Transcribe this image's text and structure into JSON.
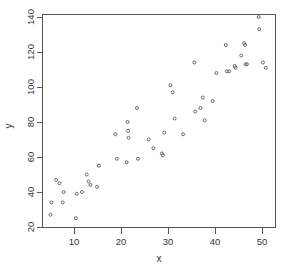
{
  "chart_data": {
    "type": "scatter",
    "title": "",
    "xlabel": "x",
    "ylabel": "y",
    "xlim": [
      3.5,
      52.5
    ],
    "ylim": [
      19,
      142
    ],
    "grid": false,
    "legend": null,
    "x_ticks": [
      10,
      20,
      30,
      40,
      50
    ],
    "y_ticks": [
      20,
      40,
      60,
      80,
      100,
      120,
      140
    ],
    "x_tick_labels": [
      "10",
      "20",
      "30",
      "40",
      "50"
    ],
    "y_tick_labels": [
      "20",
      "40",
      "60",
      "80",
      "100",
      "120",
      "140"
    ],
    "marker": "open-circle",
    "marker_color": "#6b6b6b",
    "n_points": 62,
    "points": [
      {
        "x": 5.0,
        "y": 27
      },
      {
        "x": 5.2,
        "y": 34
      },
      {
        "x": 6.2,
        "y": 47
      },
      {
        "x": 6.9,
        "y": 45
      },
      {
        "x": 7.6,
        "y": 34
      },
      {
        "x": 7.8,
        "y": 40
      },
      {
        "x": 10.4,
        "y": 25
      },
      {
        "x": 10.6,
        "y": 39
      },
      {
        "x": 11.7,
        "y": 40
      },
      {
        "x": 12.7,
        "y": 50
      },
      {
        "x": 13.1,
        "y": 46
      },
      {
        "x": 13.5,
        "y": 44
      },
      {
        "x": 14.9,
        "y": 43
      },
      {
        "x": 15.3,
        "y": 55
      },
      {
        "x": 18.8,
        "y": 73
      },
      {
        "x": 19.1,
        "y": 59
      },
      {
        "x": 21.2,
        "y": 57
      },
      {
        "x": 21.4,
        "y": 80
      },
      {
        "x": 21.5,
        "y": 75
      },
      {
        "x": 21.6,
        "y": 71
      },
      {
        "x": 23.4,
        "y": 88
      },
      {
        "x": 23.6,
        "y": 59
      },
      {
        "x": 25.9,
        "y": 70
      },
      {
        "x": 26.9,
        "y": 65
      },
      {
        "x": 28.7,
        "y": 62
      },
      {
        "x": 28.9,
        "y": 61
      },
      {
        "x": 29.2,
        "y": 74
      },
      {
        "x": 30.5,
        "y": 101
      },
      {
        "x": 31.0,
        "y": 97
      },
      {
        "x": 31.4,
        "y": 82
      },
      {
        "x": 33.2,
        "y": 73
      },
      {
        "x": 35.6,
        "y": 114
      },
      {
        "x": 35.8,
        "y": 86
      },
      {
        "x": 36.9,
        "y": 88
      },
      {
        "x": 37.4,
        "y": 94
      },
      {
        "x": 37.8,
        "y": 81
      },
      {
        "x": 39.5,
        "y": 92
      },
      {
        "x": 40.3,
        "y": 108
      },
      {
        "x": 42.3,
        "y": 124
      },
      {
        "x": 42.5,
        "y": 109
      },
      {
        "x": 43.0,
        "y": 109
      },
      {
        "x": 44.2,
        "y": 112
      },
      {
        "x": 44.4,
        "y": 111
      },
      {
        "x": 45.6,
        "y": 118
      },
      {
        "x": 46.2,
        "y": 125
      },
      {
        "x": 46.4,
        "y": 124
      },
      {
        "x": 46.5,
        "y": 113
      },
      {
        "x": 46.8,
        "y": 113
      },
      {
        "x": 49.3,
        "y": 140
      },
      {
        "x": 49.4,
        "y": 133
      },
      {
        "x": 50.2,
        "y": 114
      },
      {
        "x": 50.8,
        "y": 111
      }
    ]
  },
  "axis": {
    "x_title": "x",
    "y_title": "y"
  }
}
